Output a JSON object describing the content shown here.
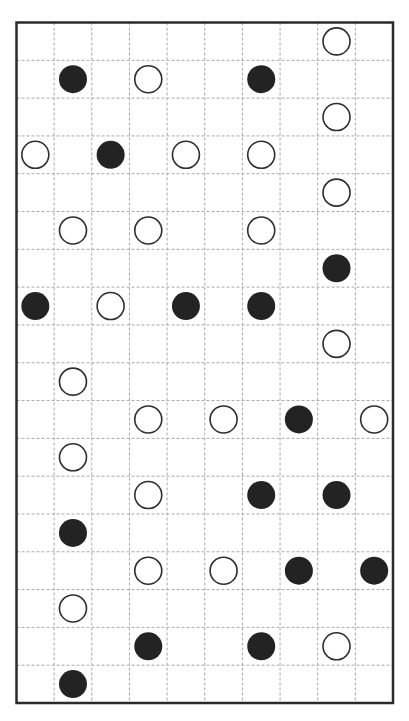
{
  "puzzle": {
    "type": "masyu-style pearl grid",
    "rows": 18,
    "cols": 10,
    "colors": {
      "background": "#ffffff",
      "border": "#2b2b2b",
      "grid": "#a8a8a8",
      "black_pearl": "#232323",
      "white_pearl_fill": "#ffffff",
      "white_pearl_stroke": "#2e2e2e"
    },
    "pearls": [
      {
        "row": 0,
        "col": 8,
        "color": "white"
      },
      {
        "row": 1,
        "col": 1,
        "color": "black"
      },
      {
        "row": 1,
        "col": 3,
        "color": "white"
      },
      {
        "row": 1,
        "col": 6,
        "color": "black"
      },
      {
        "row": 2,
        "col": 8,
        "color": "white"
      },
      {
        "row": 3,
        "col": 0,
        "color": "white"
      },
      {
        "row": 3,
        "col": 2,
        "color": "black"
      },
      {
        "row": 3,
        "col": 4,
        "color": "white"
      },
      {
        "row": 3,
        "col": 6,
        "color": "white"
      },
      {
        "row": 4,
        "col": 8,
        "color": "white"
      },
      {
        "row": 5,
        "col": 1,
        "color": "white"
      },
      {
        "row": 5,
        "col": 3,
        "color": "white"
      },
      {
        "row": 5,
        "col": 6,
        "color": "white"
      },
      {
        "row": 6,
        "col": 8,
        "color": "black"
      },
      {
        "row": 7,
        "col": 0,
        "color": "black"
      },
      {
        "row": 7,
        "col": 2,
        "color": "white"
      },
      {
        "row": 7,
        "col": 4,
        "color": "black"
      },
      {
        "row": 7,
        "col": 6,
        "color": "black"
      },
      {
        "row": 8,
        "col": 8,
        "color": "white"
      },
      {
        "row": 9,
        "col": 1,
        "color": "white"
      },
      {
        "row": 10,
        "col": 3,
        "color": "white"
      },
      {
        "row": 10,
        "col": 5,
        "color": "white"
      },
      {
        "row": 10,
        "col": 7,
        "color": "black"
      },
      {
        "row": 10,
        "col": 9,
        "color": "white"
      },
      {
        "row": 11,
        "col": 1,
        "color": "white"
      },
      {
        "row": 12,
        "col": 3,
        "color": "white"
      },
      {
        "row": 12,
        "col": 6,
        "color": "black"
      },
      {
        "row": 12,
        "col": 8,
        "color": "black"
      },
      {
        "row": 13,
        "col": 1,
        "color": "black"
      },
      {
        "row": 14,
        "col": 3,
        "color": "white"
      },
      {
        "row": 14,
        "col": 5,
        "color": "white"
      },
      {
        "row": 14,
        "col": 7,
        "color": "black"
      },
      {
        "row": 14,
        "col": 9,
        "color": "black"
      },
      {
        "row": 15,
        "col": 1,
        "color": "white"
      },
      {
        "row": 16,
        "col": 3,
        "color": "black"
      },
      {
        "row": 16,
        "col": 6,
        "color": "black"
      },
      {
        "row": 16,
        "col": 8,
        "color": "white"
      },
      {
        "row": 17,
        "col": 1,
        "color": "black"
      }
    ]
  }
}
